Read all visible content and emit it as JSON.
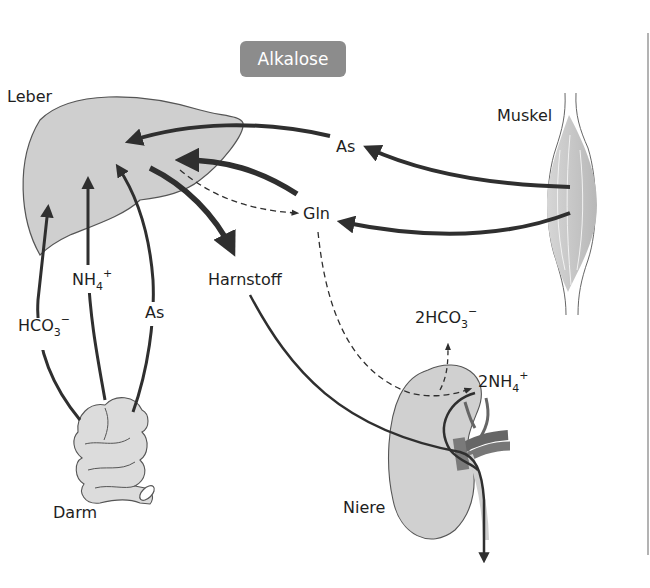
{
  "title": {
    "label": "Alkalose",
    "bg_color": "#8c8c8c",
    "text_color": "#ffffff"
  },
  "organs": {
    "liver": {
      "label": "Leber"
    },
    "muscle": {
      "label": "Muskel"
    },
    "intestine": {
      "label": "Darm"
    },
    "kidney": {
      "label": "Niere"
    }
  },
  "metabolites": {
    "as_muscle": {
      "label": "As"
    },
    "gln": {
      "label": "Gln"
    },
    "harnstoff": {
      "label": "Harnstoff"
    },
    "nh4_gut": {
      "base": "NH",
      "sub": "4",
      "sup": "+"
    },
    "hco3_gut": {
      "base": "HCO",
      "sub": "3",
      "sup": "−"
    },
    "as_gut": {
      "label": "As"
    },
    "hco3_kidney": {
      "base": "2HCO",
      "sub": "3",
      "sup": "−"
    },
    "nh4_kidney": {
      "base": "2NH",
      "sub": "4",
      "sup": "+"
    }
  },
  "colors": {
    "organ_fill": "#cfcfcf",
    "organ_stroke": "#555555",
    "arrow": "#2f2f2f",
    "vessel": "#6e6e6e"
  }
}
